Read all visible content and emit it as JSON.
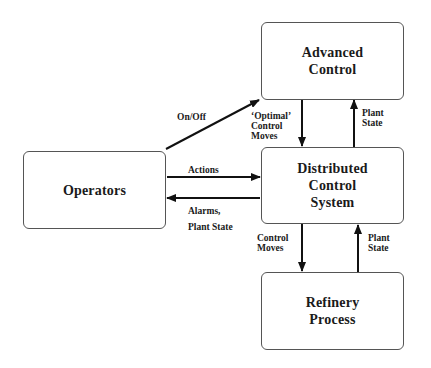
{
  "nodes": {
    "advanced_control": {
      "label": "Advanced\nControl"
    },
    "operators": {
      "label": "Operators"
    },
    "dcs": {
      "label": "Distributed\nControl\nSystem"
    },
    "refinery": {
      "label": "Refinery\nProcess"
    }
  },
  "edges": {
    "on_off": {
      "label": "On/Off",
      "from": "Operators",
      "to": "Advanced Control"
    },
    "optimal_moves": {
      "label": "‘Optimal’\nControl\nMoves",
      "from": "Advanced Control",
      "to": "Distributed Control System"
    },
    "plant_state_upper": {
      "label": "Plant\nState",
      "from": "Distributed Control System",
      "to": "Advanced Control"
    },
    "actions": {
      "label": "Actions",
      "from": "Operators",
      "to": "Distributed Control System"
    },
    "alarms": {
      "label": "Alarms,\nPlant State",
      "from": "Distributed Control System",
      "to": "Operators"
    },
    "control_moves": {
      "label": "Control\nMoves",
      "from": "Distributed Control System",
      "to": "Refinery Process"
    },
    "plant_state_lower": {
      "label": "Plant\nState",
      "from": "Refinery Process",
      "to": "Distributed Control System"
    }
  },
  "colors": {
    "stroke": "#111111",
    "box_border": "#555555",
    "background": "#ffffff"
  }
}
